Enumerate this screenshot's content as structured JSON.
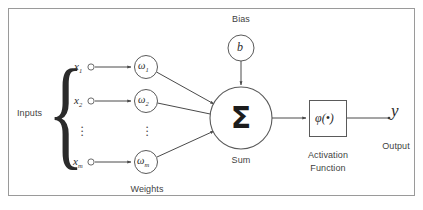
{
  "figure": {
    "type": "diagram",
    "frame_color": "#9a9a9a",
    "stroke_color": "#555555",
    "text_color": "#3f3f3f",
    "background": "#ffffff"
  },
  "labels": {
    "bias": "Bias",
    "inputs": "Inputs",
    "weights": "Weights",
    "sum": "Sum",
    "activation_line1": "Activation",
    "activation_line2": "Function",
    "output": "Output"
  },
  "nodes": {
    "bias": {
      "symbol": "b",
      "shape": "circle"
    },
    "sum": {
      "symbol": "Σ",
      "shape": "circle"
    },
    "activation": {
      "symbol": "φ(•)",
      "shape": "square"
    },
    "output": {
      "symbol": "y"
    }
  },
  "inputs": [
    {
      "symbol": "x",
      "subscript": "1"
    },
    {
      "symbol": "x",
      "subscript": "2"
    },
    {
      "symbol": "⋮",
      "subscript": ""
    },
    {
      "symbol": "x",
      "subscript": "m"
    }
  ],
  "weights": [
    {
      "symbol": "ω",
      "subscript": "1"
    },
    {
      "symbol": "ω",
      "subscript": "2"
    },
    {
      "symbol": "⋮",
      "subscript": ""
    },
    {
      "symbol": "ω",
      "subscript": "m"
    }
  ],
  "connections": {
    "input_to_weight": 3,
    "weight_to_sum": 3,
    "bias_to_sum": 1,
    "sum_to_activation": 1,
    "activation_to_output": 1
  }
}
